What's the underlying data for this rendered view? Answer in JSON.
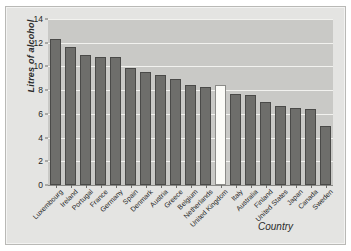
{
  "chart_data": {
    "type": "bar",
    "title": "",
    "xlabel": "Country",
    "ylabel": "Litres of alcohol",
    "ylim": [
      0,
      14
    ],
    "yticks": [
      0,
      2,
      4,
      6,
      8,
      10,
      12,
      14
    ],
    "grid": true,
    "legend": "none",
    "highlight_category": "United Kingdom",
    "categories": [
      "Luxembourg",
      "Ireland",
      "Portugal",
      "France",
      "Germany",
      "Spain",
      "Denmark",
      "Austria",
      "Greece",
      "Belgium",
      "Netherlands",
      "United Kingdom",
      "Italy",
      "Australia",
      "Finland",
      "United States",
      "Japan",
      "Canada",
      "Sweden"
    ],
    "values": [
      12.3,
      11.6,
      11.0,
      10.8,
      10.8,
      9.9,
      9.5,
      9.3,
      8.9,
      8.4,
      8.3,
      8.4,
      7.7,
      7.6,
      7.0,
      6.7,
      6.5,
      6.4,
      5.0
    ],
    "colors": {
      "bar": "#6e6e6b",
      "bar_edge": "#4a4a48",
      "highlight_bar": "#fbfbf7",
      "plot_background": "#c9c9c6",
      "figure_background": "#e4e4e2",
      "gridline": "#f2f2ef",
      "axis": "#6e6e6b",
      "text": "#1f1f1f"
    }
  }
}
